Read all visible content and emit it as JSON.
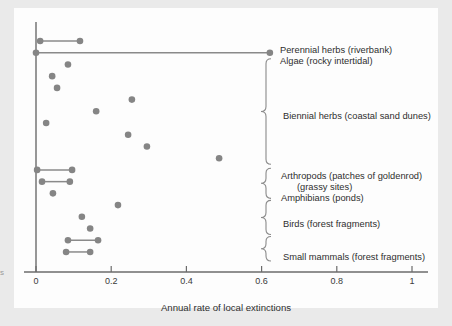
{
  "figure": {
    "background_color": "#eaeaea",
    "plate_color": "#fdfdfd",
    "dot_color": "#858585",
    "line_color": "#8a8a8a",
    "axis_color": "#6b6b6b"
  },
  "axis": {
    "xlabel": "Annual rate of local extinctions",
    "ticks": [
      {
        "value": 0,
        "label": "0"
      },
      {
        "value": 0.2,
        "label": "0.2"
      },
      {
        "value": 0.4,
        "label": "0.4"
      },
      {
        "value": 0.6,
        "label": "0.6"
      },
      {
        "value": 0.8,
        "label": "0.8"
      },
      {
        "value": 1.0,
        "label": "1"
      }
    ]
  },
  "labels": {
    "perennial_herbs": "Perennial herbs (riverbank)",
    "algae": "Algae (rocky intertidal)",
    "biennial_herbs": "Biennial herbs (coastal sand dunes)",
    "arthropods": "Arthropods (patches of goldenrod)",
    "arthropods_second": "(grassy sites)",
    "amphibians": "Amphibians (ponds)",
    "birds": "Birds (forest fragments)",
    "small_mammals": "Small mammals (forest fragments)"
  },
  "chart_data": {
    "type": "scatter",
    "title": "",
    "xlabel": "Annual rate of local extinctions",
    "ylabel": "",
    "xlim": [
      0,
      1.06
    ],
    "grid": false,
    "legend": "right-side bracketed group labels",
    "orientation": "horizontal dot-and-range plot",
    "groups": [
      {
        "name": "Perennial herbs (riverbank)",
        "rows": [
          {
            "row": 1,
            "type": "range",
            "values": [
              0.011,
              0.117
            ]
          }
        ]
      },
      {
        "name": "Algae (rocky intertidal)",
        "rows": [
          {
            "row": 2,
            "type": "range",
            "values": [
              0.0,
              0.622
            ]
          }
        ]
      },
      {
        "name": "Biennial herbs (coastal sand dunes)",
        "rows": [
          {
            "row": 3,
            "type": "point",
            "values": [
              0.085
            ]
          },
          {
            "row": 4,
            "type": "point",
            "values": [
              0.043
            ]
          },
          {
            "row": 5,
            "type": "point",
            "values": [
              0.056
            ]
          },
          {
            "row": 6,
            "type": "point",
            "values": [
              0.255
            ]
          },
          {
            "row": 7,
            "type": "point",
            "values": [
              0.16
            ]
          },
          {
            "row": 8,
            "type": "point",
            "values": [
              0.027
            ]
          },
          {
            "row": 9,
            "type": "point",
            "values": [
              0.245
            ]
          },
          {
            "row": 10,
            "type": "point",
            "values": [
              0.295
            ]
          },
          {
            "row": 11,
            "type": "point",
            "values": [
              0.487
            ]
          }
        ]
      },
      {
        "name": "Arthropods (patches of goldenrod)",
        "rows": [
          {
            "row": 12,
            "type": "range",
            "values": [
              0.003,
              0.096
            ]
          }
        ]
      },
      {
        "name": "Arthropods (grassy sites)",
        "rows": [
          {
            "row": 13,
            "type": "range",
            "values": [
              0.016,
              0.09
            ]
          }
        ]
      },
      {
        "name": "Amphibians (ponds)",
        "rows": [
          {
            "row": 14,
            "type": "point",
            "values": [
              0.045
            ]
          }
        ]
      },
      {
        "name": "Birds (forest fragments)",
        "rows": [
          {
            "row": 15,
            "type": "point",
            "values": [
              0.218
            ]
          },
          {
            "row": 16,
            "type": "point",
            "values": [
              0.122
            ]
          },
          {
            "row": 17,
            "type": "point",
            "values": [
              0.144
            ]
          }
        ]
      },
      {
        "name": "Small mammals (forest fragments)",
        "rows": [
          {
            "row": 18,
            "type": "range",
            "values": [
              0.085,
              0.165
            ]
          },
          {
            "row": 19,
            "type": "range",
            "values": [
              0.08,
              0.144
            ]
          }
        ]
      }
    ]
  }
}
